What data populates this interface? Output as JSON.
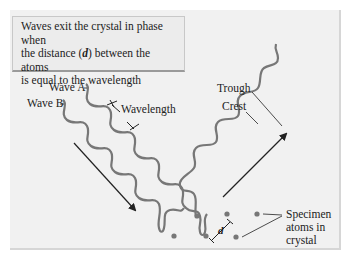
{
  "caption": {
    "line1": "Waves exit the crystal in phase when",
    "line2_pre": "the distance (",
    "line2_var": "d",
    "line2_post": ") between the atoms",
    "line3": "is equal to the wavelength"
  },
  "labels": {
    "wave_a": "Wave A",
    "wave_b": "Wave B",
    "wavelength": "Wavelength",
    "trough": "Trough",
    "crest": "Crest",
    "distance": "d",
    "specimen_1": "Specimen",
    "specimen_2": "atoms in",
    "specimen_3": "crystal"
  },
  "colors": {
    "wave": "#777777",
    "arrow": "#222222",
    "atom": "#777777",
    "panel": "#f1f1f1"
  }
}
